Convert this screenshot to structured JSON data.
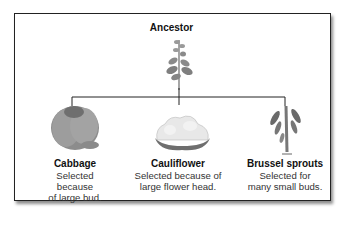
{
  "diagram": {
    "ancestor": {
      "label": "Ancestor"
    },
    "descendants": [
      {
        "name": "Cabbage",
        "desc_line1": "Selected because",
        "desc_line2": "of large bud."
      },
      {
        "name": "Cauliflower",
        "desc_line1": "Selected because of",
        "desc_line2": "large flower head."
      },
      {
        "name": "Brussel sprouts",
        "desc_line1": "Selected for",
        "desc_line2": "many small buds."
      }
    ],
    "colors": {
      "plant": "#8a8a8a",
      "plant_dark": "#5a5a5a",
      "line": "#222222",
      "cauliflower_head": "#e6e6e6"
    }
  }
}
